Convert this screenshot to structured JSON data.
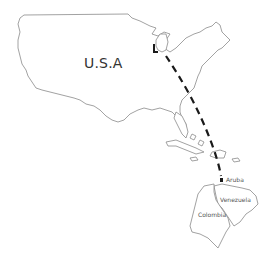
{
  "map": {
    "labels": {
      "usa": "U.S.A",
      "aruba": "Aruba",
      "venezuela": "Venezuela",
      "colombia": "Colombia"
    },
    "route": {
      "from": "Michigan (Great Lakes)",
      "to": "Aruba",
      "style": "dashed",
      "color": "#1a1a1a"
    },
    "colors": {
      "outline": "#8a8a8a",
      "background": "#ffffff",
      "route": "#1a1a1a"
    }
  }
}
